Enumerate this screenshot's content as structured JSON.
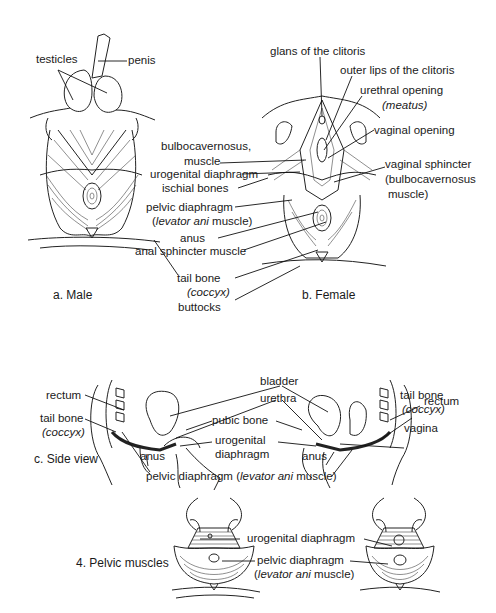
{
  "figure_a": {
    "caption": "a. Male",
    "labels": {
      "testicles": "testicles",
      "penis": "penis"
    }
  },
  "figure_b": {
    "caption": "b. Female",
    "labels": {
      "glans": "glans of the clitoris",
      "outer_lips": "outer lips of the clitoris",
      "urethral_opening": "urethral opening",
      "meatus": "(meatus)",
      "vaginal_opening": "vaginal opening",
      "vaginal_sphincter": "vaginal sphincter",
      "vaginal_sphincter_sub1": "(bulbocavernosus",
      "vaginal_sphincter_sub2": "muscle)"
    }
  },
  "shared_labels": {
    "bulbocavernosus_1": "bulbocavernosus,",
    "bulbocavernosus_2": "muscle",
    "urogenital_diaphragm": "urogenital diaphragm",
    "ischial_bones": "ischial bones",
    "pelvic_diaphragm": "pelvic diaphragm",
    "levator_open": "(",
    "levator_ani": "levator ani",
    "levator_muscle": " muscle)",
    "anus": "anus",
    "anal_sphincter": "anal sphincter muscle",
    "tail_bone": "tail bone",
    "coccyx": "(coccyx)",
    "buttocks": "buttocks"
  },
  "figure_c": {
    "caption": "c. Side view",
    "labels": {
      "bladder": "bladder",
      "urethra": "urethra",
      "pubic_bone": "pubic bone",
      "urogenital_1": "urogenital",
      "urogenital_2": "diaphragm",
      "rectum_left": "rectum",
      "tail_bone_left": "tail bone",
      "coccyx_left": "(coccyx)",
      "anus_left": "anus",
      "pelvic_diaphragm": "pelvic diaphragm",
      "levator_ani": "levator ani",
      "levator_muscle": " muscle)",
      "rectum_right": "rectum",
      "tail_bone_right": "tail bone",
      "coccyx_right": "(coccyx)",
      "vagina": "vagina",
      "anus_right": "anus"
    }
  },
  "figure_4": {
    "caption": "4. Pelvic muscles",
    "labels": {
      "urogenital_diaphragm": "urogenital diaphragm",
      "pelvic_diaphragm": "pelvic diaphragm",
      "levator_ani": "levator ani",
      "levator_muscle": " muscle)"
    }
  }
}
